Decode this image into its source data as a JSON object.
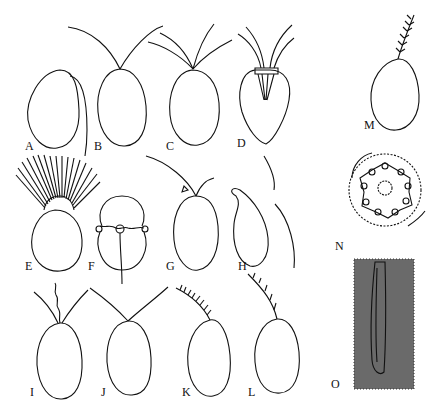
{
  "figure": {
    "panels": [
      {
        "id": "A",
        "label": "A",
        "description": "oval cell with single trailing flagellum"
      },
      {
        "id": "B",
        "label": "B",
        "description": "oval cell with two equal anterior flagella"
      },
      {
        "id": "C",
        "label": "C",
        "description": "oval cell with four anterior flagella"
      },
      {
        "id": "D",
        "label": "D",
        "description": "pear-shaped cell with four flagella arising from anterior pit"
      },
      {
        "id": "E",
        "label": "E",
        "description": "cell with anterior crown of numerous flagella"
      },
      {
        "id": "F",
        "label": "F",
        "description": "dinoflagellate-type cell with girdle and longitudinal flagellum"
      },
      {
        "id": "G",
        "label": "G",
        "description": "cell with two unequal flagella and eyespot"
      },
      {
        "id": "H",
        "label": "H",
        "description": "bean-shaped cell with lateral flagella"
      },
      {
        "id": "I",
        "label": "I",
        "description": "cell with two flagella and central haptonema"
      },
      {
        "id": "J",
        "label": "J",
        "description": "cell with two long equal flagella"
      },
      {
        "id": "K",
        "label": "K",
        "description": "cell with single tinsel (hairy) flagellum"
      },
      {
        "id": "L",
        "label": "L",
        "description": "cell with single unilateral hairy flagellum"
      },
      {
        "id": "M",
        "label": "M",
        "description": "cell with short pinnate flagellum"
      },
      {
        "id": "N",
        "label": "N",
        "description": "flagellum cross-section (9+2 axoneme)"
      },
      {
        "id": "O",
        "label": "O",
        "description": "flagellum longitudinal section micrograph"
      }
    ]
  }
}
